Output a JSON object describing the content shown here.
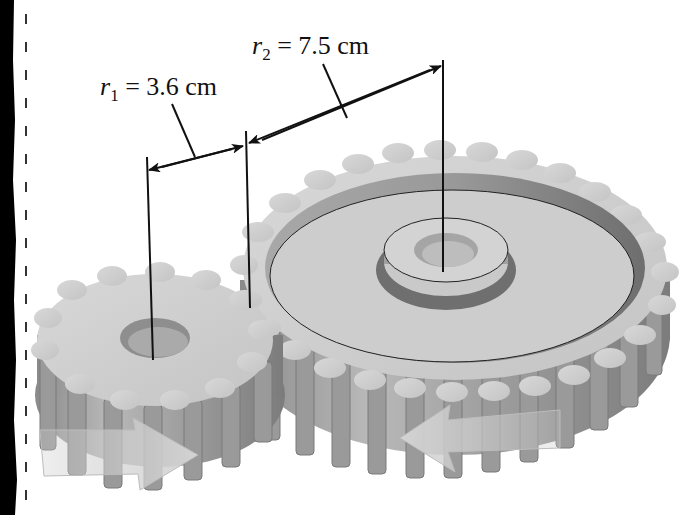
{
  "figure": {
    "background_color": "#ffffff",
    "border_color": "#000000",
    "gear_color": "#b8b8b8"
  },
  "labels": {
    "r1": {
      "symbol": "r",
      "subscript": "1",
      "equals": "=",
      "value": "3.6 cm"
    },
    "r2": {
      "symbol": "r",
      "subscript": "2",
      "equals": "=",
      "value": "7.5 cm"
    }
  },
  "gears": [
    {
      "name": "small gear",
      "radius_label": "r1",
      "radius": "3.6 cm",
      "rotation_arrow": "right"
    },
    {
      "name": "large gear",
      "radius_label": "r2",
      "radius": "7.5 cm",
      "rotation_arrow": "left"
    }
  ]
}
